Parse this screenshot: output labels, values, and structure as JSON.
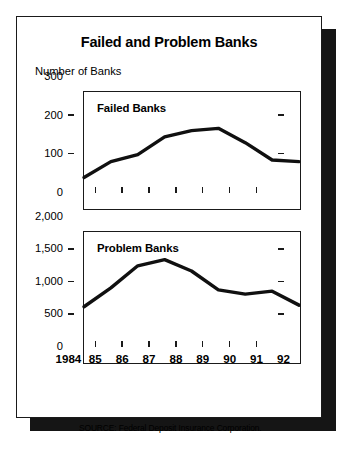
{
  "figure": {
    "title": "Failed and Problem Banks",
    "axis_caption": "Number of Banks",
    "source_note": "SOURCE:  Federal Deposit Insurance Corporation.",
    "frame_color": "#1a1a1a",
    "shadow_color": "#151515",
    "line_color": "#101010",
    "background": "#ffffff"
  },
  "chart_data": [
    {
      "type": "line",
      "title": "Failed Banks",
      "panel": "top",
      "xlabel": "",
      "ylabel": "Number of Banks",
      "x": [
        "1984",
        "85",
        "86",
        "87",
        "88",
        "89",
        "90",
        "91",
        "92"
      ],
      "categories": [
        "1984",
        "85",
        "86",
        "87",
        "88",
        "89",
        "90",
        "91",
        "92"
      ],
      "values": [
        79,
        120,
        138,
        184,
        200,
        206,
        169,
        124,
        120
      ],
      "series": [
        {
          "name": "Failed Banks",
          "values": [
            79,
            120,
            138,
            184,
            200,
            206,
            169,
            124,
            120
          ]
        }
      ],
      "ylim": [
        0,
        300
      ],
      "yticks": [
        0,
        100,
        200,
        300
      ],
      "ytick_labels": [
        "0",
        "100",
        "200",
        "300"
      ],
      "grid": false,
      "legend": "none",
      "legend_position": "inside-top-left"
    },
    {
      "type": "line",
      "title": "Problem Banks",
      "panel": "bottom",
      "xlabel": "",
      "ylabel": "Number of Banks",
      "x": [
        "1984",
        "85",
        "86",
        "87",
        "88",
        "89",
        "90",
        "91",
        "92"
      ],
      "categories": [
        "1984",
        "85",
        "86",
        "87",
        "88",
        "89",
        "90",
        "91",
        "92"
      ],
      "values": [
        850,
        1140,
        1480,
        1575,
        1400,
        1110,
        1045,
        1090,
        875
      ],
      "series": [
        {
          "name": "Problem Banks",
          "values": [
            850,
            1140,
            1480,
            1575,
            1400,
            1110,
            1045,
            1090,
            875
          ]
        }
      ],
      "ylim": [
        0,
        2000
      ],
      "yticks": [
        0,
        500,
        1000,
        1500,
        2000
      ],
      "ytick_labels": [
        "0",
        "500",
        "1,000",
        "1,500",
        "2,000"
      ],
      "grid": false,
      "legend": "none",
      "legend_position": "inside-top-left"
    }
  ],
  "xaxis": {
    "labels": [
      "1984",
      "85",
      "86",
      "87",
      "88",
      "89",
      "90",
      "91",
      "92"
    ]
  }
}
